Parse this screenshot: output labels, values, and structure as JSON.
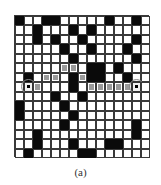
{
  "figure": {
    "caption": "(a)",
    "rows": 15,
    "cols": 15,
    "legend": {
      "0": "free",
      "1": "obstacle",
      "2": "path",
      "3": "start",
      "4": "goal"
    },
    "colors": {
      "free": "#ffffff",
      "obstacle": "#0a0a0a",
      "path": "#9a9a9a",
      "gridline": "#3a3a3a"
    },
    "start": [
      7,
      1
    ],
    "goal": [
      7,
      13
    ],
    "grid": [
      [
        1,
        0,
        0,
        1,
        1,
        0,
        0,
        0,
        0,
        0,
        1,
        0,
        0,
        1,
        0
      ],
      [
        0,
        0,
        1,
        0,
        0,
        0,
        1,
        0,
        1,
        0,
        0,
        0,
        0,
        0,
        0
      ],
      [
        0,
        0,
        1,
        0,
        1,
        0,
        0,
        1,
        0,
        0,
        0,
        0,
        0,
        1,
        0
      ],
      [
        0,
        0,
        0,
        0,
        0,
        1,
        0,
        0,
        1,
        0,
        0,
        0,
        1,
        0,
        0
      ],
      [
        0,
        0,
        0,
        0,
        0,
        0,
        1,
        0,
        0,
        0,
        0,
        0,
        0,
        1,
        0
      ],
      [
        0,
        0,
        0,
        0,
        0,
        2,
        2,
        0,
        1,
        1,
        0,
        1,
        0,
        0,
        0
      ],
      [
        0,
        1,
        0,
        2,
        2,
        0,
        1,
        2,
        1,
        1,
        0,
        0,
        1,
        0,
        0
      ],
      [
        0,
        3,
        2,
        0,
        0,
        0,
        1,
        0,
        2,
        2,
        2,
        2,
        2,
        4,
        0
      ],
      [
        0,
        0,
        0,
        0,
        1,
        0,
        0,
        1,
        0,
        0,
        0,
        0,
        0,
        0,
        0
      ],
      [
        1,
        0,
        0,
        0,
        0,
        1,
        0,
        0,
        0,
        0,
        0,
        0,
        0,
        0,
        0
      ],
      [
        1,
        0,
        0,
        0,
        0,
        0,
        1,
        0,
        0,
        0,
        0,
        0,
        0,
        0,
        0
      ],
      [
        0,
        0,
        0,
        0,
        0,
        1,
        0,
        0,
        0,
        0,
        0,
        0,
        0,
        1,
        0
      ],
      [
        0,
        0,
        1,
        0,
        0,
        0,
        0,
        0,
        0,
        0,
        0,
        0,
        0,
        1,
        0
      ],
      [
        0,
        0,
        1,
        0,
        0,
        0,
        1,
        0,
        0,
        0,
        1,
        1,
        0,
        0,
        0
      ],
      [
        0,
        1,
        0,
        0,
        0,
        0,
        0,
        1,
        1,
        0,
        0,
        0,
        0,
        0,
        0
      ]
    ]
  }
}
